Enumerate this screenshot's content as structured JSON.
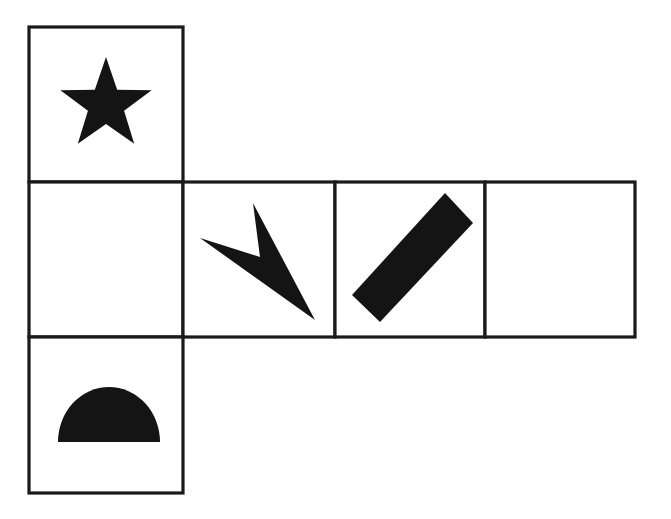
{
  "figure": {
    "kind": "cube-net-diagram",
    "background_color": "#ffffff",
    "ink_color": "#141414",
    "line_color": "#1a1a1a",
    "line_width": 3.2,
    "width": 671,
    "height": 519
  },
  "cells": [
    {
      "id": "cell-top",
      "name": "top-face",
      "row": 0,
      "column": 0,
      "x": 29,
      "y": 27,
      "width": 154,
      "height": 155,
      "symbol": "star",
      "symbol_label": "five-pointed star"
    },
    {
      "id": "cell-middle-1",
      "name": "middle-face-1",
      "row": 1,
      "column": 0,
      "x": 29,
      "y": 182,
      "width": 154,
      "height": 155,
      "symbol": "none",
      "symbol_label": "empty"
    },
    {
      "id": "cell-middle-2",
      "name": "middle-face-2",
      "row": 1,
      "column": 1,
      "x": 183,
      "y": 182,
      "width": 152,
      "height": 155,
      "symbol": "arrow-chevron",
      "symbol_label": "sharp chevron arrow pointing down-right"
    },
    {
      "id": "cell-middle-3",
      "name": "middle-face-3",
      "row": 1,
      "column": 2,
      "x": 335,
      "y": 182,
      "width": 150,
      "height": 155,
      "symbol": "diagonal-bar",
      "symbol_label": "tilted solid bar leaning right"
    },
    {
      "id": "cell-middle-4",
      "name": "middle-face-4",
      "row": 1,
      "column": 3,
      "x": 485,
      "y": 182,
      "width": 150,
      "height": 155,
      "symbol": "none",
      "symbol_label": "empty"
    },
    {
      "id": "cell-bottom",
      "name": "bottom-face",
      "row": 2,
      "column": 0,
      "x": 29,
      "y": 337,
      "width": 154,
      "height": 156,
      "symbol": "semicircle",
      "symbol_label": "filled semicircle, flat edge down"
    }
  ],
  "shapes": {
    "star": {
      "center_x": 106,
      "center_y": 105,
      "outer_radius": 48,
      "inner_radius": 19,
      "points": 5,
      "rotation_deg": -90
    },
    "arrow_chevron": {
      "polygon": "253,203 260,257 200,238 315,320"
    },
    "diagonal_bar": {
      "polygon": "445,193 473,223 380,322 352,295"
    },
    "semicircle": {
      "center_x": 109,
      "base_y": 442,
      "radius_x": 51,
      "radius_y": 55
    }
  }
}
